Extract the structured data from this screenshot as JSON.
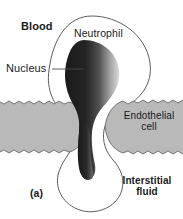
{
  "figure": {
    "panel_label": "(a)",
    "width": 183,
    "height": 219,
    "background_color": "#ffffff"
  },
  "labels": {
    "blood": "Blood",
    "nucleus": "Nucleus",
    "neutrophil": "Neutrophil",
    "endothelial_cell": "Endothelial\ncell",
    "interstitial_fluid": "Interstitial\nfluid"
  },
  "colors": {
    "endothelial_fill": "#b9b9b9",
    "endothelial_stroke": "#4a4a4a",
    "cell_outline": "#4a4a4a",
    "nucleus_dark": "#191919",
    "nucleus_light": "#d8d8d8",
    "text": "#1a1a1a",
    "leader_line": "#4a4a4a"
  },
  "structures": [
    {
      "name": "neutrophil-outline",
      "description": "thin outlined leukocyte squeezing between two endothelial cells"
    },
    {
      "name": "nucleus",
      "description": "dark gradient teardrop-shaped nucleus spanning the gap"
    },
    {
      "name": "endothelial-cell-left",
      "description": "gray band with wavy edges on the left"
    },
    {
      "name": "endothelial-cell-right",
      "description": "gray band with wavy edges on the right"
    }
  ]
}
